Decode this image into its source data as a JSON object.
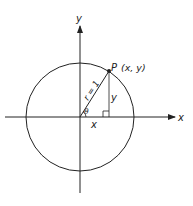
{
  "diagram": {
    "colors": {
      "ink": "#222222",
      "background": "#ffffff"
    },
    "axes": {
      "x_label": "x",
      "y_label": "y"
    },
    "circle": {
      "radius_label": "r = 1"
    },
    "point": {
      "name": "P",
      "coords": "(x, y)"
    },
    "angle_label": "θ",
    "segment_labels": {
      "horizontal": "x",
      "vertical": "y"
    }
  }
}
